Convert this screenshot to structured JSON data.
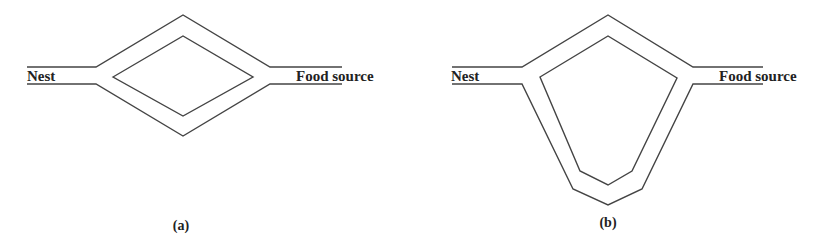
{
  "figure": {
    "panels": [
      {
        "id": "a",
        "caption": "(a)",
        "left_label": "Nest",
        "right_label": "Food source",
        "shape": "diamond"
      },
      {
        "id": "b",
        "caption": "(b)",
        "left_label": "Nest",
        "right_label": "Food source",
        "shape": "pentagon-long-lower-branch"
      }
    ],
    "colors": {
      "line": "#444444",
      "text": "#222222",
      "background": "#ffffff"
    }
  }
}
